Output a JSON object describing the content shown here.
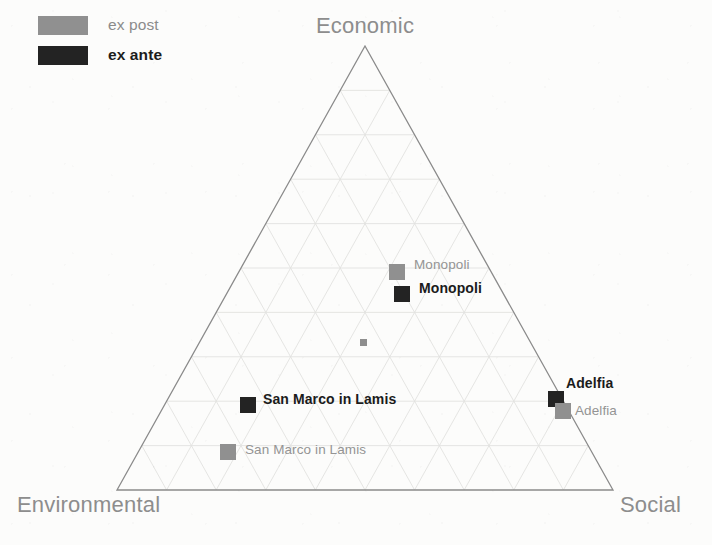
{
  "chart_data": {
    "type": "scatter",
    "plot_style": "ternary",
    "title": "",
    "axes": {
      "top": "Economic",
      "left": "Environmental",
      "right": "Social"
    },
    "grid": true,
    "grid_divisions": 10,
    "legend": {
      "position": "top-left",
      "entries": [
        {
          "key": "post",
          "label": "ex post",
          "color": "#909090",
          "weight": "normal"
        },
        {
          "key": "ante",
          "label": "ex ante",
          "color": "#232323",
          "weight": "bold"
        }
      ]
    },
    "series": [
      {
        "name": "ex post",
        "color": "#909090",
        "points": [
          {
            "label": "Monopoli",
            "px": 397,
            "py": 272,
            "label_px": 414,
            "label_py": 265
          },
          {
            "label": "Adelfia",
            "px": 563,
            "py": 411,
            "label_px": 575,
            "label_py": 411
          },
          {
            "label": "San Marco in Lamis",
            "px": 228,
            "py": 452,
            "label_px": 245,
            "label_py": 450
          }
        ]
      },
      {
        "name": "ex ante",
        "color": "#232323",
        "points": [
          {
            "label": "Monopoli",
            "px": 402,
            "py": 294,
            "label_px": 419,
            "label_py": 288
          },
          {
            "label": "Adelfia",
            "px": 556,
            "py": 399,
            "label_px": 566,
            "label_py": 383
          },
          {
            "label": "San Marco in Lamis",
            "px": 248,
            "py": 405,
            "label_px": 263,
            "label_py": 399
          }
        ]
      }
    ],
    "unlabeled_marks": [
      {
        "px": 363,
        "py": 342,
        "color": "#8e8e8e",
        "size": 7
      }
    ],
    "triangle": {
      "apex": {
        "x": 365,
        "y": 46
      },
      "bottom_left": {
        "x": 117,
        "y": 490
      },
      "bottom_right": {
        "x": 613,
        "y": 490
      },
      "outline_color": "#8a8a8a",
      "grid_color": "#e2e2e0"
    }
  },
  "legend": {
    "ex_post": "ex post",
    "ex_ante": "ex ante"
  },
  "axis_titles": {
    "economic": "Economic",
    "environmental": "Environmental",
    "social": "Social"
  },
  "points": {
    "monopoli_post": "Monopoli",
    "monopoli_ante": "Monopoli",
    "adelfia_ante": "Adelfia",
    "adelfia_post": "Adelfia",
    "sanmarco_ante": "San Marco in Lamis",
    "sanmarco_post": "San Marco in Lamis"
  }
}
